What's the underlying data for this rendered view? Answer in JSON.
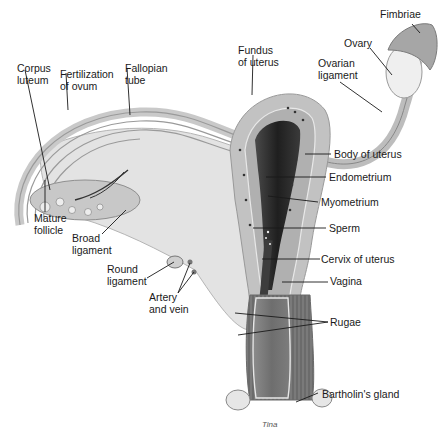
{
  "diagram": {
    "labels": {
      "fimbriae": "Fimbriae",
      "ovary": "Ovary",
      "ovarian_ligament": "Ovarian\nligament",
      "fundus_of_uterus": "Fundus\nof uterus",
      "fallopian_tube": "Fallopian\ntube",
      "fertilization_of_ovum": "Fertilization\nof ovum",
      "corpus_luteum": "Corpus\nluteum",
      "body_of_uterus": "Body of uterus",
      "endometrium": "Endometrium",
      "myometrium": "Myometrium",
      "sperm": "Sperm",
      "cervix_of_uterus": "Cervix of uterus",
      "vagina": "Vagina",
      "mature_follicle": "Mature\nfollicle",
      "broad_ligament": "Broad\nligament",
      "round_ligament": "Round\nligament",
      "artery_and_vein": "Artery\nand vein",
      "rugae": "Rugae",
      "bartholins_gland": "Bartholin's gland"
    },
    "signature": "Tina",
    "colors": {
      "tissue_light": "#d9d9d9",
      "tissue_mid": "#a9a9a9",
      "tissue_dark": "#5a5a5a",
      "cavity": "#2b2b2b",
      "leader_line": "#1a1a1a"
    }
  }
}
